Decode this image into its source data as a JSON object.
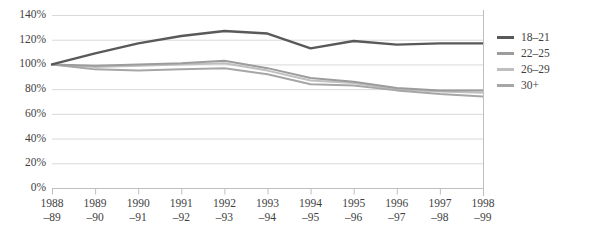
{
  "chart_data": {
    "type": "line",
    "title": "",
    "xlabel": "",
    "ylabel": "",
    "ylim": [
      0,
      140
    ],
    "ytick_step": 20,
    "ytick_labels": [
      "140%",
      "120%",
      "100%",
      "80%",
      "60%",
      "40%",
      "20%",
      "0%"
    ],
    "ytick_values": [
      140,
      120,
      100,
      80,
      60,
      40,
      20,
      0
    ],
    "grid": true,
    "grid_axis": "y",
    "legend_position": "right",
    "categories": [
      "1988–89",
      "1989–90",
      "1990–91",
      "1991–92",
      "1992–93",
      "1993–94",
      "1994–95",
      "1995–96",
      "1996–97",
      "1997–98",
      "1998–99"
    ],
    "category_lines": [
      [
        "1988",
        "–89"
      ],
      [
        "1989",
        "–90"
      ],
      [
        "1990",
        "–91"
      ],
      [
        "1991",
        "–92"
      ],
      [
        "1992",
        "–93"
      ],
      [
        "1993",
        "–94"
      ],
      [
        "1994",
        "–95"
      ],
      [
        "1995",
        "–96"
      ],
      [
        "1996",
        "–97"
      ],
      [
        "1997",
        "–98"
      ],
      [
        "1998",
        "–99"
      ]
    ],
    "series": [
      {
        "name": "18–21",
        "color": "#595959",
        "values": [
          100,
          109,
          117,
          123,
          127,
          125,
          113,
          119,
          116,
          117,
          117
        ]
      },
      {
        "name": "22–25",
        "color": "#9c9c9c",
        "values": [
          100,
          99,
          100,
          101,
          103,
          97,
          89,
          86,
          81,
          79,
          79
        ]
      },
      {
        "name": "26–29",
        "color": "#bfbfbf",
        "values": [
          100,
          98,
          99,
          100,
          101,
          95,
          87,
          85,
          80,
          78,
          77
        ]
      },
      {
        "name": "30+",
        "color": "#a6a6a6",
        "values": [
          100,
          96,
          95,
          96,
          97,
          92,
          84,
          83,
          79,
          76,
          74
        ]
      }
    ]
  },
  "legend": {
    "entries": [
      "18–21",
      "22–25",
      "26–29",
      "30+"
    ]
  },
  "colors": {
    "gridline": "#d9d9d9",
    "axis": "#bfbfbf",
    "text": "#3f3f3f",
    "background": "#ffffff"
  }
}
